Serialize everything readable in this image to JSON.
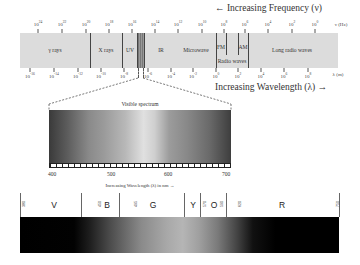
{
  "header": {
    "frequency_arrow": "← Increasing Frequency (ν)",
    "wavelength_arrow": "Increasing Wavelength (λ) →"
  },
  "frequency_axis": {
    "unit": "ν (Hz)",
    "ticks": [
      {
        "base": "10",
        "exp": "24",
        "x": 38
      },
      {
        "base": "10",
        "exp": "22",
        "x": 62
      },
      {
        "base": "10",
        "exp": "20",
        "x": 86
      },
      {
        "base": "10",
        "exp": "18",
        "x": 109
      },
      {
        "base": "10",
        "exp": "16",
        "x": 132
      },
      {
        "base": "10",
        "exp": "14",
        "x": 155
      },
      {
        "base": "10",
        "exp": "12",
        "x": 178
      },
      {
        "base": "10",
        "exp": "10",
        "x": 202
      },
      {
        "base": "10",
        "exp": "8",
        "x": 224
      },
      {
        "base": "10",
        "exp": "6",
        "x": 245
      },
      {
        "base": "10",
        "exp": "4",
        "x": 268
      },
      {
        "base": "10",
        "exp": "2",
        "x": 292
      },
      {
        "base": "10",
        "exp": "0",
        "x": 315
      }
    ]
  },
  "wavelength_axis": {
    "unit": "λ (m)",
    "ticks": [
      {
        "base": "10",
        "exp": "-16",
        "x": 30
      },
      {
        "base": "10",
        "exp": "-14",
        "x": 54
      },
      {
        "base": "10",
        "exp": "-12",
        "x": 78
      },
      {
        "base": "10",
        "exp": "-10",
        "x": 101
      },
      {
        "base": "10",
        "exp": "-8",
        "x": 124
      },
      {
        "base": "10",
        "exp": "-6",
        "x": 148
      },
      {
        "base": "10",
        "exp": "-4",
        "x": 171
      },
      {
        "base": "10",
        "exp": "-2",
        "x": 193
      },
      {
        "base": "10",
        "exp": "0",
        "x": 216
      },
      {
        "base": "10",
        "exp": "2",
        "x": 238
      },
      {
        "base": "10",
        "exp": "4",
        "x": 261
      },
      {
        "base": "10",
        "exp": "6",
        "x": 284
      },
      {
        "base": "10",
        "exp": "8",
        "x": 308
      }
    ]
  },
  "bands": [
    {
      "label": "γ rays",
      "center": 55
    },
    {
      "label": "X rays",
      "center": 106
    },
    {
      "label": "UV",
      "center": 130
    },
    {
      "label": "IR",
      "center": 161
    },
    {
      "label": "Microwave",
      "center": 196
    },
    {
      "label": "FM",
      "center": 221
    },
    {
      "label": "AM",
      "center": 243
    },
    {
      "label": "Long radio waves",
      "center": 292
    }
  ],
  "radio_waves_label": "Radio waves",
  "visible_spectrum": {
    "title": "Visible spectrum",
    "tick_labels": [
      {
        "label": "400",
        "x": 52
      },
      {
        "label": "500",
        "x": 111
      },
      {
        "label": "600",
        "x": 168
      },
      {
        "label": "700",
        "x": 226
      }
    ],
    "caption": "Increasing Wavelength (λ) in nm →"
  },
  "color_bands": {
    "boundaries_nm": [
      {
        "label": "380",
        "x": 2
      },
      {
        "label": "450",
        "x": 78
      },
      {
        "label": "495",
        "x": 114
      },
      {
        "label": "570",
        "x": 183
      },
      {
        "label": "590",
        "x": 200
      },
      {
        "label": "620",
        "x": 218
      },
      {
        "label": "750",
        "x": 316
      }
    ],
    "divider_x": [
      0,
      61,
      99,
      164,
      180,
      206,
      319
    ],
    "letters": [
      {
        "label": "V",
        "x": 34
      },
      {
        "label": "B",
        "x": 87
      },
      {
        "label": "G",
        "x": 133
      },
      {
        "label": "Y",
        "x": 173
      },
      {
        "label": "O",
        "x": 194
      },
      {
        "label": "R",
        "x": 262
      }
    ]
  }
}
